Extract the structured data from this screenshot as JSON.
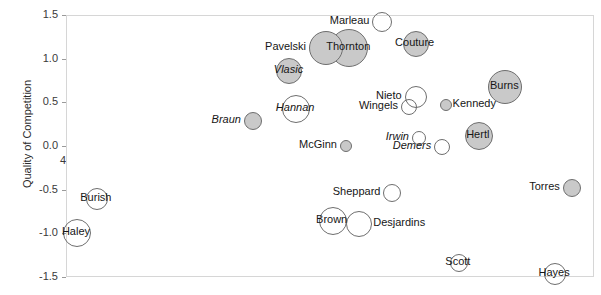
{
  "chart_data": {
    "type": "scatter",
    "title": "",
    "subtitle": "",
    "xlabel": "",
    "ylabel": "Quality of Competition",
    "xlim": [
      41,
      56.9
    ],
    "ylim": [
      -1.5,
      1.5
    ],
    "x_ticks": [
      41,
      44,
      47,
      50,
      53,
      56
    ],
    "y_ticks": [
      1.5,
      1.0,
      0.5,
      0.0,
      -0.5,
      -1.0,
      -1.5
    ],
    "x_tick_labels": [
      "41",
      "44",
      "47",
      "50",
      "53",
      "56"
    ],
    "y_tick_labels": [
      "1.5",
      "1.0",
      "0.5",
      "0.0",
      "-0.5",
      "-1.0",
      "-1.5"
    ],
    "grid": false,
    "legend": "none",
    "note": "Bubble size encodes a third variable; filled gray vs hollow white markers denote two groups.",
    "points": [
      {
        "label": "Marleau",
        "x": 50.5,
        "y": 1.43,
        "r": 10,
        "fill": "hollow",
        "italic": false,
        "label_pos": "left"
      },
      {
        "label": "Thornton",
        "x": 49.5,
        "y": 1.13,
        "r": 19,
        "fill": "filled",
        "italic": false,
        "label_pos": "center"
      },
      {
        "label": "Pavelski",
        "x": 48.8,
        "y": 1.13,
        "r": 17,
        "fill": "filled",
        "italic": false,
        "label_pos": "left"
      },
      {
        "label": "Couture",
        "x": 51.5,
        "y": 1.18,
        "r": 13,
        "fill": "filled",
        "italic": false,
        "label_pos": "center"
      },
      {
        "label": "Vlasic",
        "x": 47.7,
        "y": 0.87,
        "r": 13,
        "fill": "filled",
        "italic": true,
        "label_pos": "center"
      },
      {
        "label": "Burns",
        "x": 54.2,
        "y": 0.69,
        "r": 17,
        "fill": "filled",
        "italic": false,
        "label_pos": "center"
      },
      {
        "label": "Nieto",
        "x": 51.5,
        "y": 0.57,
        "r": 11,
        "fill": "hollow",
        "italic": false,
        "label_pos": "left"
      },
      {
        "label": "Wingels",
        "x": 51.3,
        "y": 0.46,
        "r": 8,
        "fill": "hollow",
        "italic": false,
        "label_pos": "left"
      },
      {
        "label": "Kennedy",
        "x": 52.4,
        "y": 0.48,
        "r": 6,
        "fill": "filled",
        "italic": false,
        "label_pos": "right"
      },
      {
        "label": "Hannan",
        "x": 47.9,
        "y": 0.44,
        "r": 14,
        "fill": "hollow",
        "italic": true,
        "label_pos": "center"
      },
      {
        "label": "Braun",
        "x": 46.6,
        "y": 0.3,
        "r": 9,
        "fill": "filled",
        "italic": true,
        "label_pos": "left"
      },
      {
        "label": "Hertl",
        "x": 53.4,
        "y": 0.13,
        "r": 14,
        "fill": "filled",
        "italic": false,
        "label_pos": "center"
      },
      {
        "label": "Irwin",
        "x": 51.6,
        "y": 0.1,
        "r": 7,
        "fill": "hollow",
        "italic": true,
        "label_pos": "left"
      },
      {
        "label": "Demers",
        "x": 52.3,
        "y": 0.0,
        "r": 8,
        "fill": "hollow",
        "italic": true,
        "label_pos": "left"
      },
      {
        "label": "McGinn",
        "x": 49.4,
        "y": 0.01,
        "r": 6,
        "fill": "filled",
        "italic": false,
        "label_pos": "left"
      },
      {
        "label": "Torres",
        "x": 56.2,
        "y": -0.47,
        "r": 9,
        "fill": "filled",
        "italic": false,
        "label_pos": "left"
      },
      {
        "label": "Sheppard",
        "x": 50.8,
        "y": -0.53,
        "r": 9,
        "fill": "hollow",
        "italic": false,
        "label_pos": "left"
      },
      {
        "label": "Burish",
        "x": 41.9,
        "y": -0.6,
        "r": 11,
        "fill": "hollow",
        "italic": false,
        "label_pos": "center"
      },
      {
        "label": "Brown",
        "x": 49.0,
        "y": -0.85,
        "r": 14,
        "fill": "hollow",
        "italic": false,
        "label_pos": "center"
      },
      {
        "label": "Desjardins",
        "x": 49.8,
        "y": -0.88,
        "r": 13,
        "fill": "hollow",
        "italic": false,
        "label_pos": "right"
      },
      {
        "label": "Haley",
        "x": 41.3,
        "y": -0.99,
        "r": 14,
        "fill": "hollow",
        "italic": false,
        "label_pos": "center"
      },
      {
        "label": "Scott",
        "x": 52.8,
        "y": -1.33,
        "r": 9,
        "fill": "hollow",
        "italic": false,
        "label_pos": "center"
      },
      {
        "label": "Hayes",
        "x": 55.7,
        "y": -1.45,
        "r": 11,
        "fill": "hollow",
        "italic": false,
        "label_pos": "center"
      }
    ]
  },
  "colors": {
    "marker_fill": "#c9c9c9",
    "marker_stroke": "#6e6e6e",
    "axis_line": "#d6d6d6",
    "tick_text": "#3a3a3a",
    "label_text": "#161616",
    "background": "#ffffff"
  }
}
